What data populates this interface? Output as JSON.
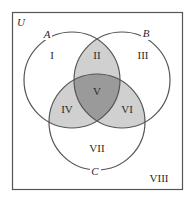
{
  "diagram": {
    "type": "venn-3-set",
    "universe": {
      "label": "U",
      "border_color": "#555555",
      "background": "#ffffff"
    },
    "sets": [
      {
        "id": "A",
        "label": "A",
        "cx": 72,
        "cy": 80,
        "r": 48
      },
      {
        "id": "B",
        "label": "B",
        "cx": 122,
        "cy": 80,
        "r": 48
      },
      {
        "id": "C",
        "label": "C",
        "cx": 97,
        "cy": 122,
        "r": 48
      }
    ],
    "regions": [
      {
        "id": "I",
        "label": "I",
        "description": "A only"
      },
      {
        "id": "II",
        "label": "II",
        "description": "A and B only",
        "shaded": "light"
      },
      {
        "id": "III",
        "label": "III",
        "description": "B only"
      },
      {
        "id": "IV",
        "label": "IV",
        "description": "A and C only",
        "shaded": "light"
      },
      {
        "id": "V",
        "label": "V",
        "description": "A, B and C",
        "shaded": "dark"
      },
      {
        "id": "VI",
        "label": "VI",
        "description": "B and C only",
        "shaded": "light"
      },
      {
        "id": "VII",
        "label": "VII",
        "description": "C only"
      },
      {
        "id": "VIII",
        "label": "VIII",
        "description": "outside A, B and C"
      }
    ],
    "colors": {
      "outline": "#555555",
      "light_shade": "#d0d0d0",
      "dark_shade": "#9a9a9a",
      "text": "#2a2a2a"
    }
  }
}
